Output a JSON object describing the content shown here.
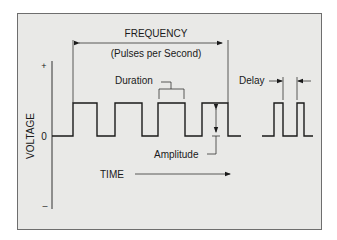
{
  "colors": {
    "page_bg": "#ffffff",
    "panel_bg": "#e9e9e7",
    "panel_border": "#6e6e6e",
    "ink": "#1a1a1a"
  },
  "labels": {
    "frequency": "FREQUENCY",
    "frequency_sub": "(Pulses per Second)",
    "duration": "Duration",
    "delay": "Delay",
    "amplitude": "Amplitude",
    "time": "TIME",
    "voltage": "VOLTAGE",
    "plus": "+",
    "zero": "0",
    "minus": "–"
  },
  "geometry": {
    "panel": {
      "x": 17,
      "y": 13,
      "w": 304,
      "h": 216
    },
    "y_axis": {
      "x": 52,
      "top": 61,
      "bottom": 209
    },
    "baseline_y": 136,
    "high_y": 103,
    "pulse_train_1": {
      "start_x": 52,
      "end_x": 241,
      "pulses": [
        [
          73,
          97
        ],
        [
          115,
          142
        ],
        [
          158,
          185
        ],
        [
          202,
          228
        ]
      ]
    },
    "pulse_train_2": {
      "start_x": 262,
      "end_x": 313,
      "pulses": [
        [
          274,
          283
        ],
        [
          297,
          304
        ]
      ]
    }
  }
}
